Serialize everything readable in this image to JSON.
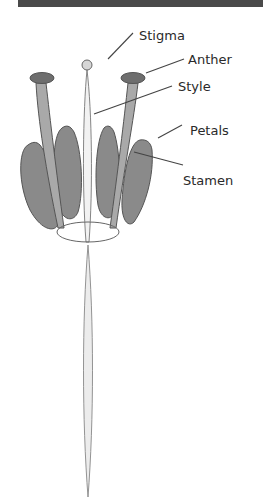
{
  "diagram": {
    "labels": {
      "stigma": "Stigma",
      "anther": "Anther",
      "style": "Style",
      "petals": "Petals",
      "stamen": "Stamen"
    },
    "colors": {
      "petal": "#8a8a8a",
      "stamen_filament": "#a9a9a9",
      "anther": "#6e6e6e",
      "stigma": "#d6d6d6",
      "style": "#efefef",
      "outline": "#555555",
      "header_bar": "#4a4a4a"
    }
  }
}
